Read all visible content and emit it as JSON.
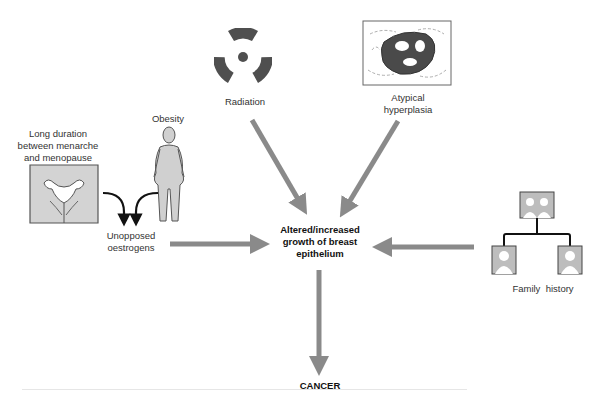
{
  "diagram": {
    "type": "causal flow diagram",
    "colors": {
      "arrow": "#8a8a8a",
      "figure_fill": "#d0d0d0",
      "dark": "#555555"
    },
    "factors": {
      "long_duration": "Long duration between menarche and menopause",
      "long_duration_lines": [
        "Long duration",
        "between menarche",
        "and menopause"
      ],
      "obesity": "Obesity",
      "unopposed_lines": [
        "Unopposed",
        "oestrogens"
      ],
      "radiation": "Radiation",
      "atypical_lines": [
        "Atypical",
        "hyperplasia"
      ],
      "family_history": "Family  history"
    },
    "center_lines": [
      "Altered/increased",
      "growth of breast",
      "epithelium"
    ],
    "outcome": "CANCER"
  }
}
